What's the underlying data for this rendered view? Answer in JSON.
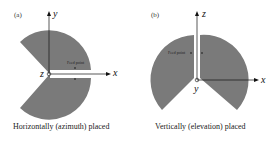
{
  "panels": [
    {
      "tag": "(a)",
      "caption": "Horizontally (azimuth) placed",
      "axes": {
        "vertical": "y",
        "horizontal": "x",
        "origin": "z"
      },
      "annotation": "Feed point",
      "fill_color": "#7a7a7a"
    },
    {
      "tag": "(b)",
      "caption": "Vertically (elevation) placed",
      "axes": {
        "vertical": "z",
        "horizontal": "x",
        "origin": "y"
      },
      "annotation": "Feed point",
      "fill_color": "#7a7a7a"
    }
  ]
}
